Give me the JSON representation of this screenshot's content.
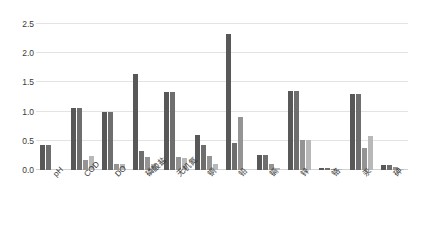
{
  "chart_data": {
    "type": "bar",
    "title": "",
    "xlabel": "",
    "ylabel": "",
    "ylim": [
      0.0,
      2.5
    ],
    "yticks": [
      "0.0",
      "0.5",
      "1.0",
      "1.5",
      "2.0",
      "2.5"
    ],
    "ytick_values": [
      0.0,
      0.5,
      1.0,
      1.5,
      2.0,
      2.5
    ],
    "grid": "horizontal",
    "legend": "none",
    "categories": [
      "pH",
      "COD",
      "DO",
      "磷酸盐",
      "无机氮",
      "铜",
      "铅",
      "镉",
      "锌",
      "铬",
      "汞",
      "砷"
    ],
    "series": [
      {
        "name": "series-1",
        "color": "#585858",
        "values": [
          0.42,
          1.07,
          1.0,
          1.65,
          1.34,
          0.6,
          2.33,
          0.26,
          1.35,
          0.04,
          1.31,
          0.09
        ]
      },
      {
        "name": "series-2",
        "color": "#6e6e6e",
        "values": [
          0.42,
          1.07,
          1.0,
          0.33,
          1.34,
          0.42,
          0.47,
          0.26,
          1.35,
          0.04,
          1.31,
          0.09
        ]
      },
      {
        "name": "series-3",
        "color": "#949494",
        "values": [
          0.0,
          0.17,
          0.1,
          0.23,
          0.23,
          0.24,
          0.9,
          0.11,
          0.52,
          0.02,
          0.37,
          0.05
        ]
      },
      {
        "name": "series-4",
        "color": "#b8b8b8",
        "values": [
          0.0,
          0.24,
          0.1,
          0.1,
          0.2,
          0.1,
          0.0,
          0.04,
          0.51,
          0.02,
          0.58,
          0.02
        ]
      }
    ]
  }
}
